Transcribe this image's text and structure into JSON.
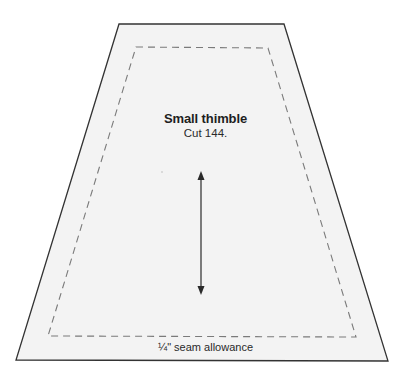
{
  "template": {
    "title": "Small thimble",
    "instruction": "Cut 144.",
    "seam_label": "¼\" seam allowance"
  },
  "shapes": {
    "outline": {
      "points": "119,24 284,24 388,361 16,360",
      "stroke": "#333333",
      "fill": "#f3f3f3"
    },
    "seam_line": {
      "points": "136,47 268,48 356,337 48,336",
      "stroke": "#777777",
      "dash": "7,5"
    },
    "grain_arrow": {
      "x": 201,
      "y1": 172,
      "y2": 294,
      "color": "#2a2a2a"
    }
  },
  "icons": {
    "grain_arrow": "double-headed-vertical-arrow"
  }
}
